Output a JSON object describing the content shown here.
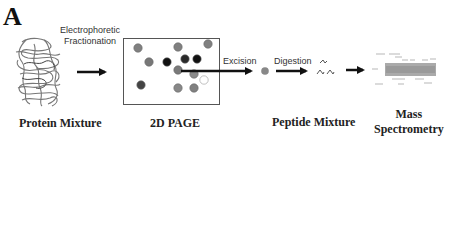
{
  "panel": {
    "letter": "A"
  },
  "stages": [
    {
      "id": "protein-mixture",
      "label": "Protein Mixture"
    },
    {
      "id": "2d-page",
      "label": "2D PAGE"
    },
    {
      "id": "peptide-mixture",
      "label": "Peptide Mixture"
    },
    {
      "id": "mass-spectrometry",
      "label_line1": "Mass",
      "label_line2": "Spectrometry"
    }
  ],
  "steps": [
    {
      "id": "electrophoretic-fractionation",
      "label_line1": "Electrophoretic",
      "label_line2": "Fractionation"
    },
    {
      "id": "excision",
      "label": "Excision"
    },
    {
      "id": "digestion",
      "label": "Digestion"
    }
  ],
  "gel_spots": [
    {
      "x": 138,
      "y": 48,
      "color": "#808080"
    },
    {
      "x": 178,
      "y": 47,
      "color": "#808080"
    },
    {
      "x": 208,
      "y": 44,
      "color": "#808080"
    },
    {
      "x": 149,
      "y": 62,
      "color": "#777777"
    },
    {
      "x": 167,
      "y": 62,
      "color": "#111111"
    },
    {
      "x": 185,
      "y": 59,
      "color": "#2a2a2a"
    },
    {
      "x": 197,
      "y": 59,
      "color": "#111111"
    },
    {
      "x": 178,
      "y": 70,
      "color": "#7a7a7a"
    },
    {
      "x": 194,
      "y": 74,
      "color": "#8a8a8a"
    },
    {
      "x": 204,
      "y": 80,
      "color": "#ffffff"
    },
    {
      "x": 141,
      "y": 85,
      "color": "#444444"
    },
    {
      "x": 178,
      "y": 88,
      "color": "#888888"
    },
    {
      "x": 194,
      "y": 88,
      "color": "#808080"
    }
  ],
  "colors": {
    "arrow": "#111111",
    "spot_excised": "#888888",
    "protein_strand": "#777777"
  }
}
